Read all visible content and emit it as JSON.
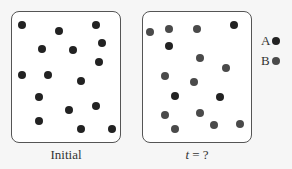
{
  "panels": [
    {
      "id": "initial",
      "label": "Initial",
      "box": {
        "x": 11,
        "y": 11,
        "w": 110,
        "h": 132
      },
      "dots": [
        {
          "x": 22,
          "y": 25,
          "type": "A"
        },
        {
          "x": 59,
          "y": 31,
          "type": "A"
        },
        {
          "x": 96,
          "y": 25,
          "type": "A"
        },
        {
          "x": 42,
          "y": 49,
          "type": "A"
        },
        {
          "x": 73,
          "y": 50,
          "type": "A"
        },
        {
          "x": 102,
          "y": 43,
          "type": "A"
        },
        {
          "x": 99,
          "y": 62,
          "type": "A"
        },
        {
          "x": 22,
          "y": 75,
          "type": "A"
        },
        {
          "x": 48,
          "y": 75,
          "type": "A"
        },
        {
          "x": 81,
          "y": 81,
          "type": "A"
        },
        {
          "x": 39,
          "y": 97,
          "type": "A"
        },
        {
          "x": 69,
          "y": 110,
          "type": "A"
        },
        {
          "x": 96,
          "y": 106,
          "type": "A"
        },
        {
          "x": 39,
          "y": 121,
          "type": "A"
        },
        {
          "x": 81,
          "y": 129,
          "type": "A"
        },
        {
          "x": 112,
          "y": 129,
          "type": "A"
        }
      ]
    },
    {
      "id": "t",
      "label_italic": "t",
      "label_rest": " = ?",
      "box": {
        "x": 142,
        "y": 11,
        "w": 110,
        "h": 132
      },
      "dots": [
        {
          "x": 150,
          "y": 32,
          "type": "B"
        },
        {
          "x": 169,
          "y": 29,
          "type": "B"
        },
        {
          "x": 197,
          "y": 29,
          "type": "B"
        },
        {
          "x": 234,
          "y": 25,
          "type": "A"
        },
        {
          "x": 169,
          "y": 46,
          "type": "A"
        },
        {
          "x": 200,
          "y": 58,
          "type": "B"
        },
        {
          "x": 226,
          "y": 68,
          "type": "B"
        },
        {
          "x": 165,
          "y": 76,
          "type": "B"
        },
        {
          "x": 194,
          "y": 82,
          "type": "B"
        },
        {
          "x": 175,
          "y": 96,
          "type": "A"
        },
        {
          "x": 220,
          "y": 97,
          "type": "A"
        },
        {
          "x": 165,
          "y": 115,
          "type": "B"
        },
        {
          "x": 200,
          "y": 113,
          "type": "B"
        },
        {
          "x": 175,
          "y": 129,
          "type": "B"
        },
        {
          "x": 214,
          "y": 125,
          "type": "B"
        },
        {
          "x": 240,
          "y": 124,
          "type": "B"
        }
      ]
    }
  ],
  "legend": [
    {
      "label": "A",
      "type": "A",
      "x": 261,
      "y": 41
    },
    {
      "label": "B",
      "type": "B",
      "x": 261,
      "y": 61
    }
  ],
  "colors": {
    "A": "#222222",
    "B": "#4a4a4a",
    "border": "#555555",
    "background": "#f6f6f6"
  }
}
